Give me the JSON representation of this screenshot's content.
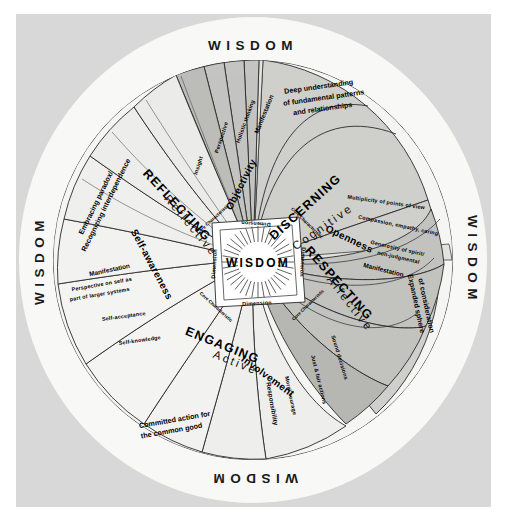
{
  "figure": {
    "type": "concentric-spiral-wheel-diagram",
    "center_label": "WISDOM",
    "outer_ring_label": "WISDOM",
    "outer_ring_positions": [
      "top",
      "right",
      "bottom",
      "left"
    ],
    "colors": {
      "page_background": "#d8d8d8",
      "wheel_white": "#f7f7f5",
      "band_light": "#e9e9e7",
      "band_mid": "#c9c9c6",
      "band_dark": "#b3b3b0",
      "stroke": "#1a1a1a",
      "text": "#111111"
    }
  },
  "center": {
    "label": "WISDOM",
    "ring_labels": {
      "dimension": "Dimension",
      "core_characteristic": "Core Characteristic"
    }
  },
  "quadrants": [
    {
      "id": "discerning",
      "name": "DISCERNING",
      "mode": "Cognitive",
      "core_characteristic": "Objectivity",
      "dimensions": [
        "Insight",
        "Perspective",
        "Holistic thinking"
      ],
      "manifestation_label": "Manifestation",
      "outcome": "Deep understanding of fundamental patterns and relationships"
    },
    {
      "id": "respecting",
      "name": "RESPECTING",
      "mode": "Affective",
      "core_characteristic": "Openness",
      "dimensions": [
        "Multiplicity of points of view",
        "Compassion, empathy, caring",
        "Generosity of spirit/ non-judgmental"
      ],
      "manifestation_label": "Manifestation",
      "outcome": "Expanded sphere of consideration"
    },
    {
      "id": "engaging",
      "name": "ENGAGING",
      "mode": "Active",
      "core_characteristic": "Involvement",
      "dimensions": [
        "Sound decisions",
        "Just & fair actions",
        "Moral courage"
      ],
      "manifestation_label": "Responsibility",
      "outcome": "Committed action for the common good"
    },
    {
      "id": "reflecting",
      "name": "REFLECTING",
      "mode": "Reflective",
      "core_characteristic": "Self-awareness",
      "dimensions": [
        "Self-knowledge",
        "Self-acceptance",
        "Perspective on self as part of larger systems"
      ],
      "manifestation_label": "Manifestation",
      "outcome": "Embracing paradox/ Recognizing interdependence"
    }
  ],
  "text_items": {
    "wisdom_top": "WISDOM",
    "wisdom_right": "WISDOM",
    "wisdom_bottom": "WISDOM",
    "wisdom_left": "WISDOM",
    "discerning_name": "DISCERNING",
    "discerning_mode": "Cognitive",
    "objectivity": "Objectivity",
    "insight": "Insight",
    "perspective": "Perspective",
    "holistic": "Holistic thinking",
    "manif_1": "Manifestation",
    "outcome_1a": "Deep understanding",
    "outcome_1b": "of fundamental patterns",
    "outcome_1c": "and relationships",
    "respecting_name": "RESPECTING",
    "respecting_mode": "Affective",
    "openness": "Openness",
    "multiplicity": "Multiplicity of points of view",
    "compassion": "Compassion, empathy, caring",
    "generosity_a": "Generosity of spirit/",
    "generosity_b": "non-judgmental",
    "manif_2": "Manifestation",
    "outcome_2a": "Expanded sphere",
    "outcome_2b": "of consideration",
    "engaging_name": "ENGAGING",
    "engaging_mode": "Active",
    "involvement": "Involvement",
    "sound": "Sound decisions",
    "just": "Just & fair actions",
    "moral": "Moral courage",
    "manif_3": "Responsibility",
    "outcome_3a": "Committed action for",
    "outcome_3b": "the common good",
    "reflecting_name": "REFLECTING",
    "reflecting_mode": "Reflective",
    "selfaware": "Self-awareness",
    "selfknow": "Self-knowledge",
    "selfacc": "Self-acceptance",
    "persp_self_a": "Perspective on self as",
    "persp_self_b": "part of larger systems",
    "manif_4": "Manifestation",
    "outcome_4a": "Embracing paradox/",
    "outcome_4b": "Recognizing interdependence",
    "center_wisdom": "WISDOM",
    "dim_top": "Dimension",
    "dim_right": "Dimension",
    "dim_bottom": "Dimension",
    "dim_left": "Dimension",
    "core_tl": "Core Characteristic",
    "core_tr": "Core Characteristic",
    "core_br": "Core Characteristic",
    "core_bl": "Core Characteristic"
  }
}
